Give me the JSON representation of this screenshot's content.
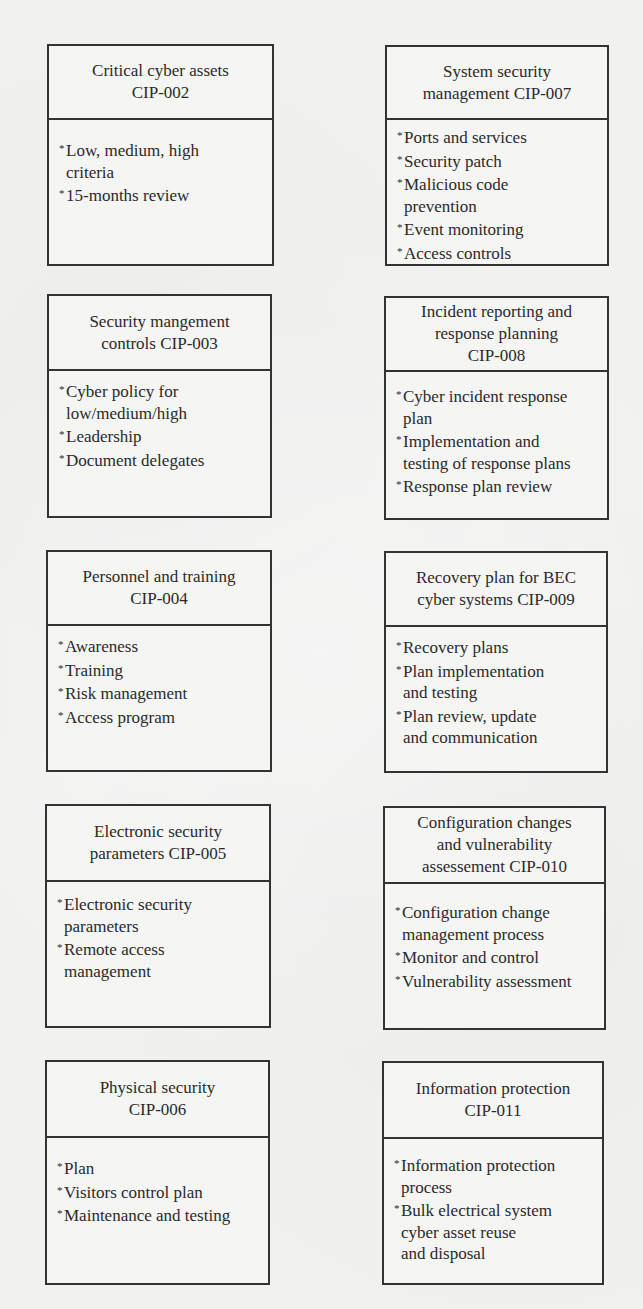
{
  "diagram": {
    "type": "grid-of-boxes",
    "bullet_marker": "*",
    "colors": {
      "background": "#f1f1f0",
      "border": "#333333",
      "text": "#2a2a2a"
    },
    "boxes": [
      {
        "id": "CIP-002",
        "title": "Critical cyber assets\nCIP-002",
        "items": [
          "Low, medium, high\ncriteria",
          "15-months review"
        ]
      },
      {
        "id": "CIP-007",
        "title": "System security\nmanagement CIP-007",
        "items": [
          "Ports and services",
          "Security patch",
          "Malicious code\nprevention",
          "Event monitoring",
          "Access controls"
        ]
      },
      {
        "id": "CIP-003",
        "title": "Security mangement\ncontrols CIP-003",
        "items": [
          "Cyber policy for\nlow/medium/high",
          "Leadership",
          "Document delegates"
        ]
      },
      {
        "id": "CIP-008",
        "title": "Incident reporting and\nresponse planning\nCIP-008",
        "items": [
          "Cyber incident response\nplan",
          "Implementation and\ntesting of response plans",
          "Response plan review"
        ]
      },
      {
        "id": "CIP-004",
        "title": "Personnel and training\nCIP-004",
        "items": [
          "Awareness",
          "Training",
          "Risk management",
          "Access program"
        ]
      },
      {
        "id": "CIP-009",
        "title": "Recovery plan for BEC\ncyber systems CIP-009",
        "items": [
          "Recovery plans",
          "Plan implementation\nand testing",
          "Plan review, update\nand communication"
        ]
      },
      {
        "id": "CIP-005",
        "title": "Electronic security\nparameters CIP-005",
        "items": [
          "Electronic security\nparameters",
          "Remote access\nmanagement"
        ]
      },
      {
        "id": "CIP-010",
        "title": "Configuration changes\nand vulnerability\nassessement CIP-010",
        "items": [
          "Configuration change\nmanagement process",
          "Monitor and control",
          "Vulnerability assessment"
        ]
      },
      {
        "id": "CIP-006",
        "title": "Physical security\nCIP-006",
        "items": [
          "Plan",
          "Visitors control plan",
          "Maintenance and testing"
        ]
      },
      {
        "id": "CIP-011",
        "title": "Information protection\nCIP-011",
        "items": [
          "Information protection\nprocess",
          "Bulk electrical system\ncyber asset reuse\nand disposal"
        ]
      }
    ]
  }
}
